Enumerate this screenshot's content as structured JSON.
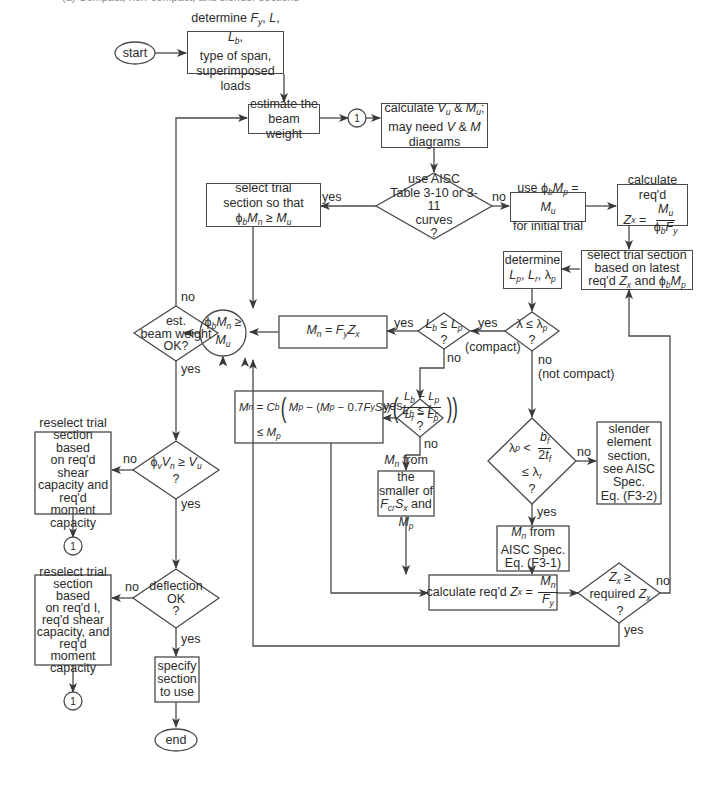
{
  "header": {
    "top_text": "(a) Compact, non-compact, and slender sections"
  },
  "nodes": {
    "start": "start",
    "end": "end",
    "connector": "1",
    "determine_inputs": [
      "determine F_y, L, L_b,",
      "type of span,",
      "superimposed loads"
    ],
    "estimate_weight": [
      "estimate the",
      "beam weight"
    ],
    "calc_vu_mu": [
      "calculate V_u & M_u;",
      "may need V & M",
      "diagrams"
    ],
    "use_aisc_tables": [
      "use AISC",
      "Table 3-10 or 3-11",
      "curves",
      "?"
    ],
    "select_trial_phi": [
      "select trial",
      "section so that",
      "φ_bM_n ≥ M_u"
    ],
    "use_phi_mp": [
      "use φ_bM_p = M_u",
      "for initial trial"
    ],
    "calc_req_zx": [
      "calculate req'd",
      "Z_x = M_u / φ_bF_y"
    ],
    "select_latest": [
      "select trial section",
      "based on latest",
      "req'd Z_x and φ_bM_p"
    ],
    "determine_lp": [
      "determine",
      "L_p, L_r, λ_p"
    ],
    "lambda_check": [
      "λ ≤ λ_p",
      "?"
    ],
    "lb_lp_check": [
      "L_b ≤ L_p",
      "?"
    ],
    "lb_lr_check": [
      "L_b ≤ L_r",
      "?"
    ],
    "mn_fyzx": "M_n = F_yZ_x",
    "phi_check": [
      "φ_bM_n ≥",
      "M_u"
    ],
    "beam_weight_ok": [
      "est.",
      "beam weight",
      "OK?"
    ],
    "mn_formula": [
      "M_n = C_b(M_p − (M_p − 0.7F_yS_x)((L_b − L_p)/(L_r − L_p)))",
      "≤ M_p"
    ],
    "slender_check": [
      "λ_p < b_f / 2t_f",
      "≤ λ_r",
      "?"
    ],
    "slender_section": [
      "slender",
      "element",
      "section,",
      "see AISC",
      "Spec.",
      "Eq. (F3-2)"
    ],
    "mn_smaller": [
      "M_n from the",
      "smaller of",
      "F_crS_x and M_p"
    ],
    "mn_f31": [
      "M_n from",
      "AISC Spec.",
      "Eq. (F3-1)"
    ],
    "calc_req_zx2": "calculate req'd Z_x = M_n / F_y",
    "zx_required": [
      "Z_x ≥",
      "required Z_x",
      "?"
    ],
    "shear_check": [
      "φ_vV_n ≥ V_u",
      "?"
    ],
    "reselect_shear": [
      "reselect trial",
      "section based",
      "on req'd shear",
      "capacity and",
      "req'd moment",
      "capacity"
    ],
    "deflection_ok": [
      "deflection",
      "OK",
      "?"
    ],
    "reselect_deflection": [
      "reselect trial",
      "section based",
      "on req'd I,",
      "req'd shear",
      "capacity, and",
      "req'd moment",
      "capacity"
    ],
    "specify_section": [
      "specify",
      "section",
      "to use"
    ]
  },
  "labels": {
    "yes": "yes",
    "no": "no",
    "compact": "(compact)",
    "not_compact": "(not compact)"
  },
  "colors": {
    "line": "#4a4a4a",
    "text": "#2b2b2b",
    "background": "#ffffff"
  }
}
